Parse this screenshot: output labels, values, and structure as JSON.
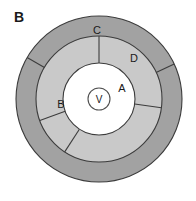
{
  "figure": {
    "panel_label": "B",
    "background_color": "#ffffff"
  },
  "diagram": {
    "type": "concentric-ring-segment-diagram",
    "center": {
      "x": 99,
      "y": 99
    },
    "rings": [
      {
        "name": "outer-ring",
        "label": "C",
        "outer_radius": 83,
        "inner_radius": 63,
        "fill_color": "#a2a2a2",
        "stroke_color": "#3c3c3c",
        "label_position": {
          "x": 97,
          "y": 34
        }
      },
      {
        "name": "middle-ring",
        "outer_radius": 63,
        "inner_radius": 36,
        "fill_color": "#c9c9c9",
        "stroke_color": "#3c3c3c",
        "segments": [
          {
            "name": "segment-b",
            "label": "B",
            "label_position": {
              "x": 61,
              "y": 108
            }
          },
          {
            "name": "segment-d",
            "label": "D",
            "label_position": {
              "x": 134,
              "y": 62
            }
          }
        ]
      },
      {
        "name": "inner-circle",
        "label": "A",
        "outer_radius": 36,
        "fill_color": "#ffffff",
        "stroke_color": "#3c3c3c",
        "label_position": {
          "x": 122,
          "y": 92
        }
      },
      {
        "name": "center-circle",
        "label": "V",
        "outer_radius": 11,
        "fill_color": "#ffffff",
        "stroke_color": "#505050",
        "label_position": {
          "x": 99,
          "y": 103
        }
      }
    ],
    "outer_ring_dividers_deg": [
      150,
      25
    ],
    "middle_ring_dividers_deg": [
      90,
      200,
      237,
      352
    ]
  }
}
